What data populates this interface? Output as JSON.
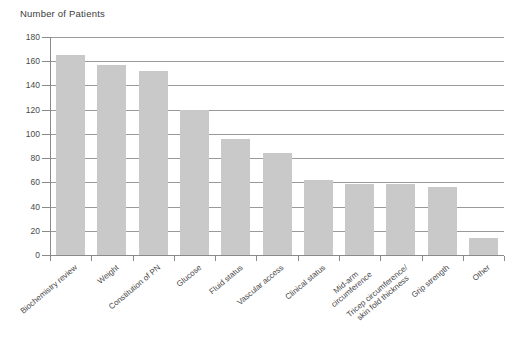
{
  "header": {
    "title": "Number of Patients"
  },
  "chart_data": {
    "type": "bar",
    "title": "Number of Patients",
    "ylabel": "Number of Patients",
    "xlabel": "",
    "categories": [
      "Biochemistry review",
      "Weight",
      "Constitution of PN",
      "Glucose",
      "Fluid status",
      "Vascular access",
      "Clinical status",
      "Mid-arm\ncircumference",
      "Tricep circumference/\nskin fold thickness",
      "Grip strength",
      "Other"
    ],
    "values": [
      165,
      157,
      152,
      120,
      96,
      84,
      62,
      59,
      59,
      56,
      14
    ],
    "ylim": [
      0,
      180
    ],
    "yticks": [
      0,
      20,
      40,
      60,
      80,
      100,
      120,
      140,
      160,
      180
    ],
    "ytick_interval": 20,
    "grid": true,
    "legend": "none",
    "x_label_rotation_deg": 40,
    "colors": {
      "bar": "#c9c9c9",
      "gridline": "#9a9a9a",
      "axis": "#8a8a8a",
      "text": "#4a4a4a"
    }
  }
}
